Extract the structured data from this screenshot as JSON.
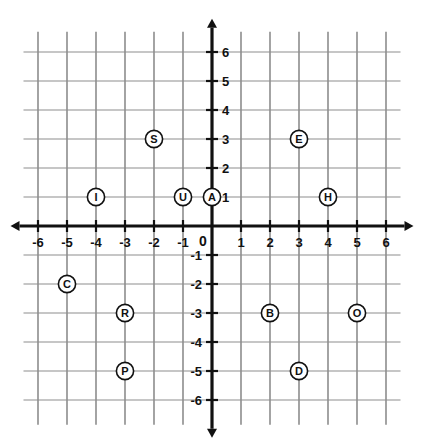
{
  "chart_data": {
    "type": "scatter",
    "title": "",
    "xlabel": "",
    "ylabel": "",
    "xlim": [
      -6.5,
      6.5
    ],
    "ylim": [
      -6.5,
      6.5
    ],
    "grid": true,
    "legend": "none",
    "origin_label": "0",
    "x_ticks": [
      -6,
      -5,
      -4,
      -3,
      -2,
      -1,
      1,
      2,
      3,
      4,
      5,
      6
    ],
    "y_ticks": [
      6,
      5,
      4,
      3,
      2,
      1,
      -1,
      -2,
      -3,
      -4,
      -5,
      -6
    ],
    "x_tick_labels": [
      "-6",
      "-5",
      "-4",
      "-3",
      "-2",
      "-1",
      "1",
      "2",
      "3",
      "4",
      "5",
      "6"
    ],
    "y_tick_labels": [
      "6",
      "5",
      "4",
      "3",
      "2",
      "1",
      "-1",
      "-2",
      "-3",
      "-4",
      "-5",
      "-6"
    ],
    "points": [
      {
        "label": "S",
        "x": -2,
        "y": 3
      },
      {
        "label": "E",
        "x": 3,
        "y": 3
      },
      {
        "label": "I",
        "x": -4,
        "y": 1
      },
      {
        "label": "U",
        "x": -1,
        "y": 1
      },
      {
        "label": "A",
        "x": 0,
        "y": 1
      },
      {
        "label": "H",
        "x": 4,
        "y": 1
      },
      {
        "label": "C",
        "x": -5,
        "y": -2
      },
      {
        "label": "R",
        "x": -3,
        "y": -3
      },
      {
        "label": "B",
        "x": 2,
        "y": -3
      },
      {
        "label": "O",
        "x": 5,
        "y": -3
      },
      {
        "label": "P",
        "x": -3,
        "y": -5
      },
      {
        "label": "D",
        "x": 3,
        "y": -5
      }
    ]
  },
  "colors": {
    "background": "#ffffff",
    "grid_vertical": "#7d7d7d",
    "grid_horizontal": "#8d8d8d",
    "axis": "#111111",
    "point_fill": "#ffffff",
    "point_stroke": "#111111",
    "text": "#111111"
  }
}
